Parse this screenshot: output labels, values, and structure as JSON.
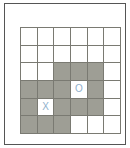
{
  "figure": {
    "type": "grid-diagram",
    "rows": 6,
    "columns": 6,
    "colors": {
      "frame_border": "#555555",
      "grid_line": "#7a7a72",
      "cell_empty": "#ffffff",
      "cell_shaded": "#9e9e95",
      "mark_text": "#8fb0cc"
    }
  },
  "grid": {
    "cells": [
      [
        {
          "shaded": false,
          "mark": ""
        },
        {
          "shaded": false,
          "mark": ""
        },
        {
          "shaded": false,
          "mark": ""
        },
        {
          "shaded": false,
          "mark": ""
        },
        {
          "shaded": false,
          "mark": ""
        },
        {
          "shaded": false,
          "mark": ""
        }
      ],
      [
        {
          "shaded": false,
          "mark": ""
        },
        {
          "shaded": false,
          "mark": ""
        },
        {
          "shaded": false,
          "mark": ""
        },
        {
          "shaded": false,
          "mark": ""
        },
        {
          "shaded": false,
          "mark": ""
        },
        {
          "shaded": false,
          "mark": ""
        }
      ],
      [
        {
          "shaded": false,
          "mark": ""
        },
        {
          "shaded": false,
          "mark": ""
        },
        {
          "shaded": true,
          "mark": ""
        },
        {
          "shaded": true,
          "mark": ""
        },
        {
          "shaded": true,
          "mark": ""
        },
        {
          "shaded": false,
          "mark": ""
        }
      ],
      [
        {
          "shaded": true,
          "mark": ""
        },
        {
          "shaded": true,
          "mark": ""
        },
        {
          "shaded": true,
          "mark": ""
        },
        {
          "shaded": false,
          "mark": "O"
        },
        {
          "shaded": true,
          "mark": ""
        },
        {
          "shaded": false,
          "mark": ""
        }
      ],
      [
        {
          "shaded": true,
          "mark": ""
        },
        {
          "shaded": false,
          "mark": "X"
        },
        {
          "shaded": true,
          "mark": ""
        },
        {
          "shaded": true,
          "mark": ""
        },
        {
          "shaded": true,
          "mark": ""
        },
        {
          "shaded": false,
          "mark": ""
        }
      ],
      [
        {
          "shaded": true,
          "mark": ""
        },
        {
          "shaded": true,
          "mark": ""
        },
        {
          "shaded": true,
          "mark": ""
        },
        {
          "shaded": false,
          "mark": ""
        },
        {
          "shaded": false,
          "mark": ""
        },
        {
          "shaded": false,
          "mark": ""
        }
      ]
    ]
  }
}
